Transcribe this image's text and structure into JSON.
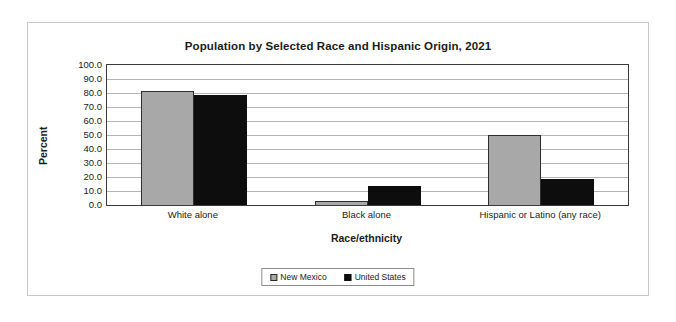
{
  "chart_data": {
    "type": "bar",
    "title": "Population by Selected Race and Hispanic Origin, 2021",
    "xlabel": "Race/ethnicity",
    "ylabel": "Percent",
    "categories": [
      "White alone",
      "Black alone",
      "Hispanic or Latino (any race)"
    ],
    "series": [
      {
        "name": "New Mexico",
        "color": "#a8a8a8",
        "values": [
          81.5,
          2.6,
          50.1
        ]
      },
      {
        "name": "United States",
        "color": "#0d0d0d",
        "values": [
          78.6,
          13.6,
          18.9
        ]
      }
    ],
    "ylim": [
      0,
      100
    ],
    "ytick_labels": [
      "100.0",
      "90.0",
      "80.0",
      "70.0",
      "60.0",
      "50.0",
      "40.0",
      "30.0",
      "20.0",
      "10.0",
      "0.0"
    ],
    "ytick_values": [
      100,
      90,
      80,
      70,
      60,
      50,
      40,
      30,
      20,
      10,
      0
    ],
    "grid": true,
    "legend_position": "bottom"
  }
}
